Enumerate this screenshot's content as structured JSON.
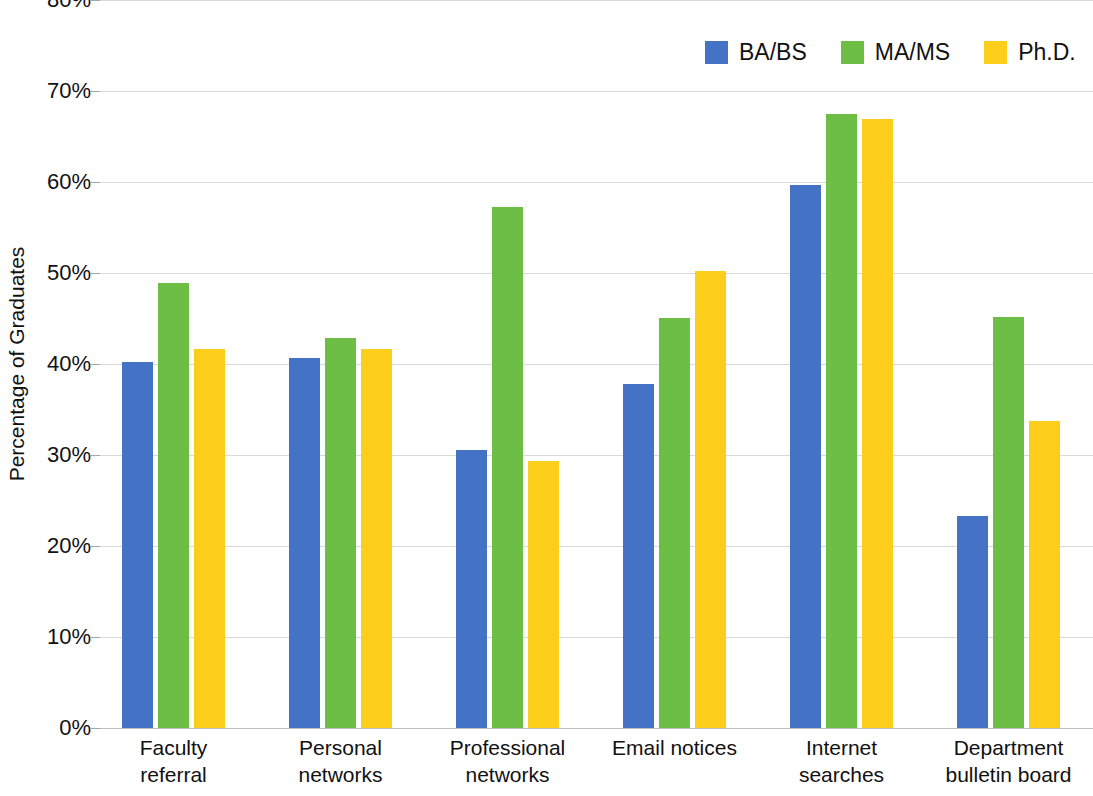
{
  "chart_data": {
    "type": "bar",
    "title": "",
    "xlabel": "",
    "ylabel": "Percentage of Graduates",
    "ylim": [
      0,
      80
    ],
    "ytick_step": 10,
    "ytick_labels": [
      "80%",
      "70%",
      "60%",
      "50%",
      "40%",
      "30%",
      "20%",
      "10%",
      "0%"
    ],
    "ytick_values": [
      80,
      70,
      60,
      50,
      40,
      30,
      20,
      10,
      0
    ],
    "grid": true,
    "legend_position": "top-right",
    "categories": [
      "Faculty\nreferral",
      "Personal\nnetworks",
      "Professional\nnetworks",
      "Email notices",
      "Internet\nsearches",
      "Department\nbulletin board"
    ],
    "series": [
      {
        "name": "BA/BS",
        "color": "#4472c4",
        "values": [
          40.2,
          40.7,
          30.6,
          37.8,
          59.7,
          23.3
        ]
      },
      {
        "name": "MA/MS",
        "color": "#6dbe45",
        "values": [
          48.9,
          42.9,
          57.3,
          45.1,
          67.5,
          45.2
        ]
      },
      {
        "name": "Ph.D.",
        "color": "#fcce1b",
        "values": [
          41.7,
          41.7,
          29.3,
          50.2,
          66.9,
          33.7
        ]
      }
    ]
  }
}
